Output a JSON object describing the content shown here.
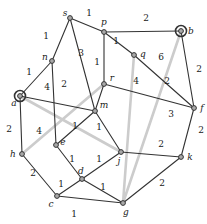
{
  "figure": {
    "type": "weighted-graph-diagram",
    "background": "#ffffff",
    "width": 207,
    "height": 224
  },
  "graph": {
    "colors": {
      "edge": "#333333",
      "highlight_edge": "#cccccc",
      "node_fill": "#a9a9a9",
      "node_stroke": "#333333",
      "node_ring": "#333333",
      "label": "#1a1a1a"
    },
    "nodes": [
      {
        "id": "s",
        "x": 70,
        "y": 18,
        "label_x": 65,
        "label_y": 16,
        "special": false
      },
      {
        "id": "p",
        "x": 104,
        "y": 32,
        "label_x": 104,
        "label_y": 25,
        "special": false
      },
      {
        "id": "b",
        "x": 181,
        "y": 31,
        "label_x": 191,
        "label_y": 34,
        "special": true
      },
      {
        "id": "n",
        "x": 52,
        "y": 61,
        "label_x": 45,
        "label_y": 60,
        "special": false
      },
      {
        "id": "q",
        "x": 134,
        "y": 55,
        "label_x": 143,
        "label_y": 57,
        "special": false
      },
      {
        "id": "r",
        "x": 104,
        "y": 84,
        "label_x": 112,
        "label_y": 81,
        "special": false
      },
      {
        "id": "a",
        "x": 20,
        "y": 96,
        "label_x": 14,
        "label_y": 106,
        "special": true
      },
      {
        "id": "m",
        "x": 95,
        "y": 111,
        "label_x": 104,
        "label_y": 108,
        "special": false
      },
      {
        "id": "f",
        "x": 194,
        "y": 108,
        "label_x": 202,
        "label_y": 111,
        "special": false
      },
      {
        "id": "e",
        "x": 56,
        "y": 145,
        "label_x": 63,
        "label_y": 145,
        "special": false
      },
      {
        "id": "h",
        "x": 22,
        "y": 154,
        "label_x": 13,
        "label_y": 157,
        "special": false
      },
      {
        "id": "j",
        "x": 121,
        "y": 152,
        "label_x": 119,
        "label_y": 164,
        "special": false
      },
      {
        "id": "k",
        "x": 181,
        "y": 157,
        "label_x": 190,
        "label_y": 160,
        "special": false
      },
      {
        "id": "d",
        "x": 82,
        "y": 179,
        "label_x": 81,
        "label_y": 174,
        "special": false
      },
      {
        "id": "c",
        "x": 57,
        "y": 196,
        "label_x": 51,
        "label_y": 207,
        "special": false
      },
      {
        "id": "g",
        "x": 123,
        "y": 203,
        "label_x": 126,
        "label_y": 215,
        "special": false
      }
    ],
    "edges": [
      {
        "from": "s",
        "to": "n",
        "weight": "1",
        "label_x": 46,
        "label_y": 39,
        "highlight": false
      },
      {
        "from": "s",
        "to": "p",
        "weight": "1",
        "label_x": 89,
        "label_y": 16,
        "highlight": false
      },
      {
        "from": "s",
        "to": "m",
        "weight": "3",
        "label_x": 81,
        "label_y": 56,
        "highlight": false
      },
      {
        "from": "p",
        "to": "b",
        "weight": "2",
        "label_x": 146,
        "label_y": 21,
        "highlight": false
      },
      {
        "from": "p",
        "to": "q",
        "weight": "1",
        "label_x": 116,
        "label_y": 44,
        "highlight": false
      },
      {
        "from": "p",
        "to": "r",
        "weight": "1",
        "label_x": 97,
        "label_y": 65,
        "highlight": false
      },
      {
        "from": "b",
        "to": "f",
        "weight": "2",
        "label_x": 199,
        "label_y": 72,
        "highlight": false
      },
      {
        "from": "q",
        "to": "f",
        "weight": "2",
        "label_x": 167,
        "label_y": 84,
        "highlight": false
      },
      {
        "from": "n",
        "to": "a",
        "weight": "1",
        "label_x": 29,
        "label_y": 75,
        "highlight": false
      },
      {
        "from": "n",
        "to": "e",
        "weight": "2",
        "label_x": 64,
        "label_y": 87,
        "highlight": false
      },
      {
        "from": "a",
        "to": "m",
        "weight": "4",
        "label_x": 47,
        "label_y": 90,
        "highlight": false
      },
      {
        "from": "a",
        "to": "h",
        "weight": "2",
        "label_x": 9,
        "label_y": 132,
        "highlight": false
      },
      {
        "from": "r",
        "to": "f",
        "weight": "3",
        "label_x": 171,
        "label_y": 117,
        "highlight": false
      },
      {
        "from": "r",
        "to": "m",
        "weight": "",
        "label_x": 0,
        "label_y": 0,
        "highlight": false
      },
      {
        "from": "m",
        "to": "e",
        "weight": "1",
        "label_x": 75,
        "label_y": 129,
        "highlight": false
      },
      {
        "from": "m",
        "to": "j",
        "weight": "1",
        "label_x": 99,
        "label_y": 130,
        "highlight": false
      },
      {
        "from": "f",
        "to": "k",
        "weight": "2",
        "label_x": 201,
        "label_y": 133,
        "highlight": false
      },
      {
        "from": "j",
        "to": "k",
        "weight": "2",
        "label_x": 161,
        "label_y": 147,
        "highlight": false
      },
      {
        "from": "h",
        "to": "c",
        "weight": "2",
        "label_x": 33,
        "label_y": 176,
        "highlight": false
      },
      {
        "from": "e",
        "to": "d",
        "weight": "1",
        "label_x": 72,
        "label_y": 162,
        "highlight": false
      },
      {
        "from": "d",
        "to": "j",
        "weight": "1",
        "label_x": 99,
        "label_y": 162,
        "highlight": false
      },
      {
        "from": "c",
        "to": "d",
        "weight": "1",
        "label_x": 61,
        "label_y": 187,
        "highlight": false
      },
      {
        "from": "d",
        "to": "g",
        "weight": "1",
        "label_x": 103,
        "label_y": 190,
        "highlight": false
      },
      {
        "from": "c",
        "to": "g",
        "weight": "1",
        "label_x": 74,
        "label_y": 217,
        "highlight": false
      },
      {
        "from": "k",
        "to": "g",
        "weight": "2",
        "label_x": 162,
        "label_y": 186,
        "highlight": false
      },
      {
        "from": "b",
        "to": "g",
        "weight": "6",
        "label_x": 161,
        "label_y": 60,
        "highlight": true
      },
      {
        "from": "q",
        "to": "g",
        "weight": "4",
        "label_x": 136,
        "label_y": 84,
        "highlight": true
      },
      {
        "from": "h",
        "to": "r",
        "weight": "4",
        "label_x": 39,
        "label_y": 134,
        "highlight": true
      },
      {
        "from": "a",
        "to": "j",
        "weight": "",
        "label_x": 0,
        "label_y": 0,
        "highlight": true
      }
    ]
  }
}
